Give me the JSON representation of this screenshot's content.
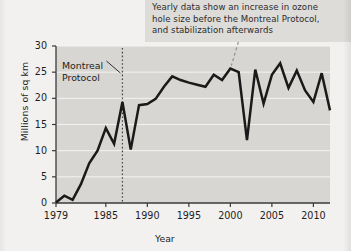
{
  "annotation": {
    "name": "chart-callout",
    "lines": [
      "Yearly data show an increase in ozone",
      "hole size before the Montreal Protocol,",
      "and stabilization afterwards"
    ]
  },
  "marker": {
    "label_lines": [
      "Montreal",
      "Protocol"
    ],
    "year": 1987
  },
  "colors": {
    "page_background": "#f2f1ef",
    "plot_background": "#d8d6d2",
    "annotation_band": "#dedcd8",
    "line": "#1a1a1a",
    "gridline": "#f4f3f1",
    "axis": "#3a3a3a",
    "text": "#1d1d1d"
  },
  "chart_data": {
    "type": "line",
    "title": "",
    "xlabel": "Year",
    "ylabel": "Millions of sq km",
    "xlim": [
      1979,
      2012
    ],
    "ylim": [
      0,
      30
    ],
    "xticks": [
      1979,
      1985,
      1990,
      1995,
      2000,
      2005,
      2010
    ],
    "xtick_labels": [
      "1979",
      "1985",
      "1990",
      "1995",
      "2000",
      "2005",
      "2010"
    ],
    "yticks": [
      0,
      5,
      10,
      15,
      20,
      25,
      30
    ],
    "ytick_labels": [
      "0",
      "5",
      "10",
      "15",
      "20",
      "25",
      "30"
    ],
    "grid": "horizontal",
    "legend": "none",
    "x": [
      1979,
      1980,
      1981,
      1982,
      1983,
      1984,
      1985,
      1986,
      1987,
      1988,
      1989,
      1990,
      1991,
      1992,
      1993,
      1994,
      1995,
      1996,
      1997,
      1998,
      1999,
      2000,
      2001,
      2002,
      2003,
      2004,
      2005,
      2006,
      2007,
      2008,
      2009,
      2010,
      2011,
      2012
    ],
    "values": [
      0.1,
      1.4,
      0.6,
      3.6,
      7.6,
      10.0,
      14.3,
      11.3,
      19.3,
      10.2,
      18.7,
      18.9,
      19.9,
      22.2,
      24.2,
      23.5,
      23.0,
      22.6,
      22.2,
      24.5,
      23.5,
      25.7,
      25.0,
      12.0,
      25.5,
      19.0,
      24.5,
      26.7,
      22.0,
      25.3,
      21.5,
      19.3,
      24.8,
      17.7
    ],
    "series_name": "Ozone hole area",
    "annotations": [
      {
        "type": "vertical-dotted-line",
        "x": 1987,
        "label": "Montreal Protocol"
      },
      {
        "type": "dashed-leader",
        "points_to_year": 2000
      }
    ]
  }
}
